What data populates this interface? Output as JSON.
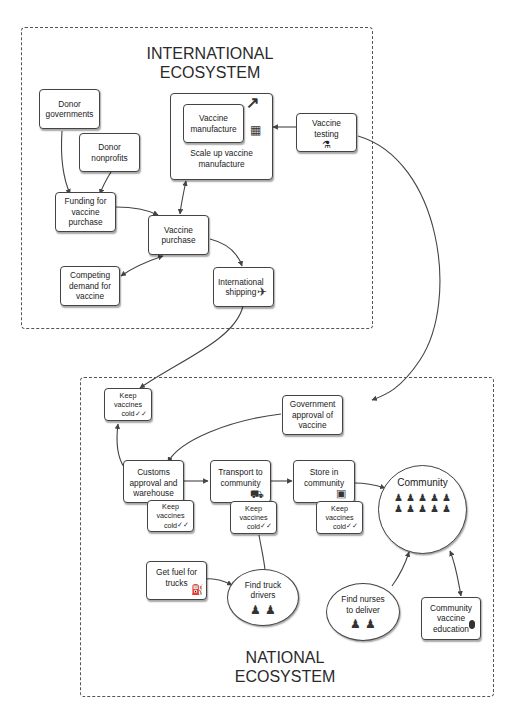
{
  "diagram": {
    "regions": {
      "international": {
        "title": "INTERNATIONAL\nECOSYSTEM"
      },
      "national": {
        "title": "NATIONAL\nECOSYSTEM"
      }
    },
    "nodes": {
      "donor_governments": {
        "label": "Donor\ngovernments"
      },
      "donor_nonprofits": {
        "label": "Donor\nnonprofits"
      },
      "funding": {
        "label": "Funding for\nvaccine\npurchase"
      },
      "scale_up": {
        "label": "Scale up vaccine\nmanufacture"
      },
      "vaccine_manufacture": {
        "label": "Vaccine\nmanufacture"
      },
      "vaccine_testing": {
        "label": "Vaccine\ntesting"
      },
      "vaccine_purchase": {
        "label": "Vaccine\npurchase"
      },
      "competing_demand": {
        "label": "Competing\ndemand for\nvaccine"
      },
      "international_shipping": {
        "label": "International\nshipping"
      },
      "keep_cold_1": {
        "label": "Keep\nvaccines\ncold"
      },
      "government_approval": {
        "label": "Government\napproval of\nvaccine"
      },
      "customs": {
        "label": "Customs\napproval and\nwarehouse"
      },
      "keep_cold_2": {
        "label": "Keep\nvaccines\ncold"
      },
      "transport": {
        "label": "Transport to\ncommunity"
      },
      "keep_cold_3": {
        "label": "Keep\nvaccines\ncold"
      },
      "store": {
        "label": "Store in\ncommunity"
      },
      "keep_cold_4": {
        "label": "Keep\nvaccines\ncold"
      },
      "community": {
        "label": "Community"
      },
      "get_fuel": {
        "label": "Get fuel for\ntrucks"
      },
      "find_drivers": {
        "label": "Find truck\ndrivers"
      },
      "find_nurses": {
        "label": "Find nurses\nto deliver"
      },
      "community_education": {
        "label": "Community\nvaccine\neducation"
      }
    },
    "icons": {
      "growth_arrow": "↗",
      "factory": "▦",
      "lab": "⚗",
      "airplane": "✈",
      "cold_check": "✓✓",
      "truck": "⛟",
      "store": "▣",
      "fuel": "⛽",
      "microphone": "🎙",
      "person": "🯅"
    },
    "colors": {
      "line": "#444444",
      "region_border": "#555555",
      "background": "#ffffff"
    }
  }
}
